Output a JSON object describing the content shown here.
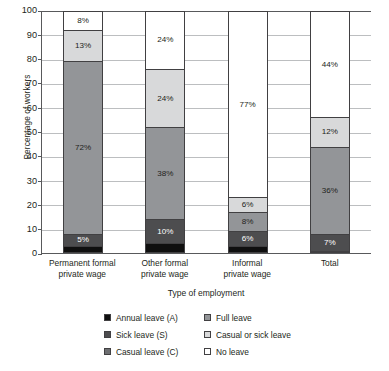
{
  "chart_data": {
    "type": "bar",
    "stacked": true,
    "orientation": "vertical",
    "title": "",
    "xlabel": "Type of employment",
    "ylabel": "Percentage of workers",
    "ylim": [
      0,
      100
    ],
    "yticks": [
      0,
      10,
      20,
      30,
      40,
      50,
      60,
      70,
      80,
      90,
      100
    ],
    "ytick_labels": [
      "0",
      "10",
      "20",
      "30",
      "40",
      "50",
      "60",
      "70",
      "80",
      "90",
      "100"
    ],
    "grid": "horizontal",
    "legend_position": "below-axis",
    "categories": [
      "Permanent formal private wage",
      "Other  formal private wage",
      "Informal private wage",
      "Total"
    ],
    "category_lines": [
      [
        "Permanent formal",
        "private wage"
      ],
      [
        "Other  formal",
        "private wage"
      ],
      [
        "Informal",
        "private wage"
      ],
      [
        "Total"
      ]
    ],
    "series": [
      {
        "name": "Annual leave (A)",
        "color": "#0f0f0f",
        "values": [
          3,
          4,
          3,
          1
        ],
        "labels": [
          "",
          "",
          "",
          ""
        ]
      },
      {
        "name": "Sick leave (S)",
        "color": "#4d4d4f",
        "values": [
          5,
          10,
          6,
          7
        ],
        "labels": [
          "5%",
          "10%",
          "6%",
          "7%"
        ]
      },
      {
        "name": "Full leave",
        "color": "#939598",
        "values": [
          72,
          38,
          8,
          36
        ],
        "labels": [
          "72%",
          "38%",
          "8%",
          "36%"
        ]
      },
      {
        "name": "Casual or sick leave",
        "color": "#d8d9da",
        "values": [
          13,
          24,
          6,
          12
        ],
        "labels": [
          "13%",
          "24%",
          "6%",
          "12%"
        ]
      },
      {
        "name": "No leave",
        "color": "#ffffff",
        "values": [
          8,
          24,
          77,
          44
        ],
        "labels": [
          "8%",
          "24%",
          "77%",
          "44%"
        ]
      }
    ],
    "legend_entries": [
      {
        "label": "Annual leave (A)",
        "color": "#0f0f0f"
      },
      {
        "label": "Full leave",
        "color": "#939598"
      },
      {
        "label": "Sick leave (S)",
        "color": "#4d4d4f"
      },
      {
        "label": "Casual or sick leave",
        "color": "#d8d9da"
      },
      {
        "label": "Casual leave (C)",
        "color": "#6d6e71"
      },
      {
        "label": "No leave",
        "color": "#ffffff"
      }
    ]
  }
}
